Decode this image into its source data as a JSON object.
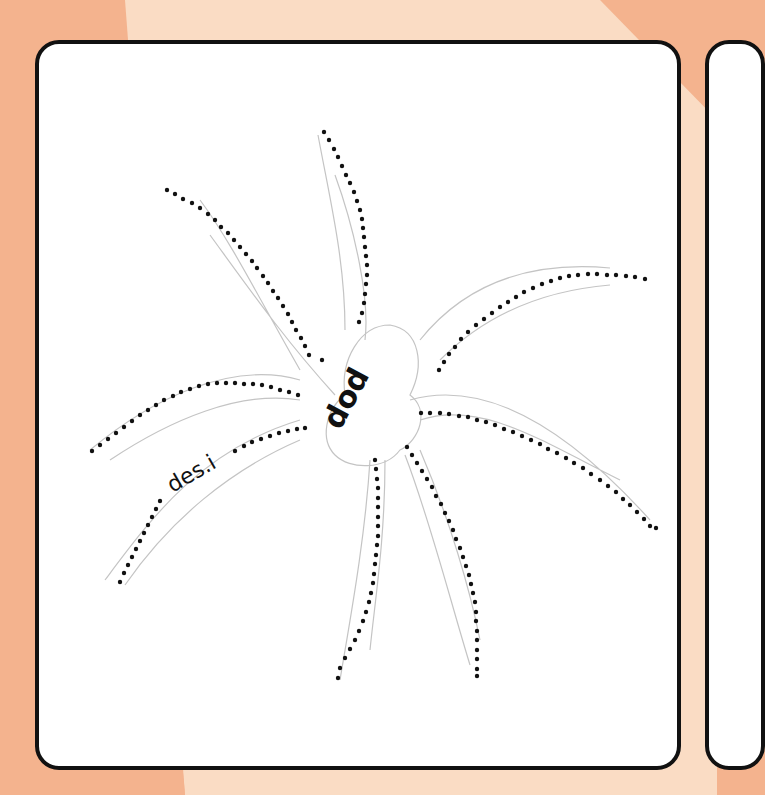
{
  "worksheet": {
    "subject": "spider tracing worksheet",
    "body_label": "dod",
    "leg_label": "des.i",
    "colors": {
      "background": "#f4b38e",
      "background_stripe": "#fadcc4",
      "card": "#ffffff",
      "card_border": "#111111",
      "outline": "#bdbdbd",
      "dots": "#111111"
    }
  }
}
